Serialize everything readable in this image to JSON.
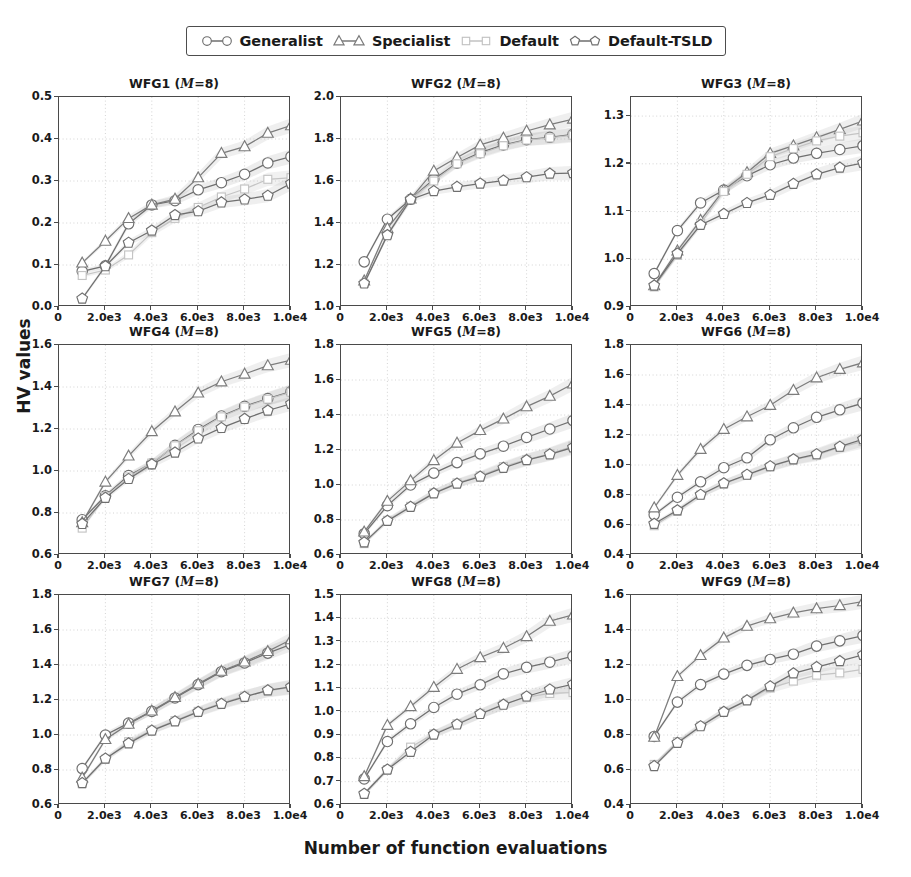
{
  "figure": {
    "xlabel": "Number of function evaluations",
    "ylabel": "HV values"
  },
  "legend": {
    "entries": [
      {
        "label": "Generalist",
        "marker": "circle",
        "color": "#6e6e6e"
      },
      {
        "label": "Specialist",
        "marker": "triangle",
        "color": "#7a7a7a"
      },
      {
        "label": "Default",
        "marker": "square",
        "color": "#c2c2c2"
      },
      {
        "label": "Default-TSLD",
        "marker": "pentagon",
        "color": "#6e6e6e"
      }
    ]
  },
  "chart_data": [
    {
      "type": "line",
      "title": "WFG1 (M=8)",
      "problem": "WFG1",
      "M": 8,
      "xlabel": "Number of function evaluations",
      "ylabel": "HV values",
      "xlim": [
        0,
        10000
      ],
      "ylim": [
        0.0,
        0.5
      ],
      "xticks": [
        0,
        2000,
        4000,
        6000,
        8000,
        10000
      ],
      "xticklabels": [
        "0",
        "2.0e3",
        "4.0e3",
        "6.0e3",
        "8.0e3",
        "1.0e4"
      ],
      "yticks": [
        0.0,
        0.1,
        0.2,
        0.3,
        0.4,
        0.5
      ],
      "yticklabels": [
        "0.0",
        "0.1",
        "0.2",
        "0.3",
        "0.4",
        "0.5"
      ],
      "grid": true,
      "legend_position": "figure-top",
      "x": [
        1000,
        2000,
        3000,
        4000,
        5000,
        6000,
        7000,
        8000,
        9000,
        10000
      ],
      "series": [
        {
          "name": "Generalist",
          "values": [
            0.085,
            0.098,
            0.198,
            0.243,
            0.253,
            0.279,
            0.296,
            0.316,
            0.343,
            0.358
          ]
        },
        {
          "name": "Specialist",
          "values": [
            0.105,
            0.157,
            0.211,
            0.243,
            0.257,
            0.308,
            0.366,
            0.382,
            0.414,
            0.432
          ]
        },
        {
          "name": "Default",
          "values": [
            0.075,
            0.088,
            0.124,
            0.177,
            0.211,
            0.237,
            0.262,
            0.281,
            0.304,
            0.308
          ]
        },
        {
          "name": "Default-TSLD",
          "values": [
            0.02,
            0.097,
            0.153,
            0.182,
            0.219,
            0.228,
            0.249,
            0.256,
            0.265,
            0.294
          ]
        }
      ]
    },
    {
      "type": "line",
      "title": "WFG2 (M=8)",
      "problem": "WFG2",
      "M": 8,
      "xlabel": "Number of function evaluations",
      "ylabel": "HV values",
      "xlim": [
        0,
        10000
      ],
      "ylim": [
        1.0,
        2.0
      ],
      "xticks": [
        0,
        2000,
        4000,
        6000,
        8000,
        10000
      ],
      "xticklabels": [
        "0",
        "2.0e3",
        "4.0e3",
        "6.0e3",
        "8.0e3",
        "1.0e4"
      ],
      "yticks": [
        1.0,
        1.2,
        1.4,
        1.6,
        1.8,
        2.0
      ],
      "yticklabels": [
        "1.0",
        "1.2",
        "1.4",
        "1.6",
        "1.8",
        "2.0"
      ],
      "grid": true,
      "legend_position": "figure-top",
      "x": [
        1000,
        2000,
        3000,
        4000,
        5000,
        6000,
        7000,
        8000,
        9000,
        10000
      ],
      "series": [
        {
          "name": "Generalist",
          "values": [
            1.215,
            1.418,
            1.513,
            1.608,
            1.685,
            1.735,
            1.772,
            1.797,
            1.808,
            1.822
          ]
        },
        {
          "name": "Specialist",
          "values": [
            1.125,
            1.375,
            1.515,
            1.648,
            1.712,
            1.772,
            1.805,
            1.838,
            1.868,
            1.895
          ]
        },
        {
          "name": "Default",
          "values": [
            1.112,
            1.345,
            1.512,
            1.6,
            1.682,
            1.73,
            1.768,
            1.795,
            1.805,
            1.818
          ]
        },
        {
          "name": "Default-TSLD",
          "values": [
            1.112,
            1.342,
            1.512,
            1.552,
            1.572,
            1.588,
            1.602,
            1.618,
            1.635,
            1.638
          ]
        }
      ]
    },
    {
      "type": "line",
      "title": "WFG3 (M=8)",
      "problem": "WFG3",
      "M": 8,
      "xlabel": "Number of function evaluations",
      "ylabel": "HV values",
      "xlim": [
        0,
        10000
      ],
      "ylim": [
        0.9,
        1.34
      ],
      "xticks": [
        0,
        2000,
        4000,
        6000,
        8000,
        10000
      ],
      "xticklabels": [
        "0",
        "2.0e3",
        "4.0e3",
        "6.0e3",
        "8.0e3",
        "1.0e4"
      ],
      "yticks": [
        0.9,
        1.0,
        1.1,
        1.2,
        1.3
      ],
      "yticklabels": [
        "0.9",
        "1.0",
        "1.1",
        "1.2",
        "1.3"
      ],
      "grid": true,
      "legend_position": "figure-top",
      "x": [
        1000,
        2000,
        3000,
        4000,
        5000,
        6000,
        7000,
        8000,
        9000,
        10000
      ],
      "series": [
        {
          "name": "Generalist",
          "values": [
            0.97,
            1.06,
            1.118,
            1.145,
            1.175,
            1.198,
            1.212,
            1.222,
            1.23,
            1.238
          ]
        },
        {
          "name": "Specialist",
          "values": [
            0.945,
            1.018,
            1.082,
            1.145,
            1.182,
            1.222,
            1.238,
            1.255,
            1.272,
            1.29
          ]
        },
        {
          "name": "Default",
          "values": [
            0.942,
            1.008,
            1.075,
            1.142,
            1.178,
            1.215,
            1.232,
            1.248,
            1.258,
            1.265
          ]
        },
        {
          "name": "Default-TSLD",
          "values": [
            0.945,
            1.012,
            1.072,
            1.095,
            1.118,
            1.135,
            1.158,
            1.178,
            1.192,
            1.202
          ]
        }
      ]
    },
    {
      "type": "line",
      "title": "WFG4 (M=8)",
      "problem": "WFG4",
      "M": 8,
      "xlabel": "Number of function evaluations",
      "ylabel": "HV values",
      "xlim": [
        0,
        10000
      ],
      "ylim": [
        0.6,
        1.6
      ],
      "xticks": [
        0,
        2000,
        4000,
        6000,
        8000,
        10000
      ],
      "xticklabels": [
        "0",
        "2.0e3",
        "4.0e3",
        "6.0e3",
        "8.0e3",
        "1.0e4"
      ],
      "yticks": [
        0.6,
        0.8,
        1.0,
        1.2,
        1.4,
        1.6
      ],
      "yticklabels": [
        "0.6",
        "0.8",
        "1.0",
        "1.2",
        "1.4",
        "1.6"
      ],
      "grid": true,
      "legend_position": "figure-top",
      "x": [
        1000,
        2000,
        3000,
        4000,
        5000,
        6000,
        7000,
        8000,
        9000,
        10000
      ],
      "series": [
        {
          "name": "Generalist",
          "values": [
            0.768,
            0.882,
            0.978,
            1.035,
            1.122,
            1.198,
            1.262,
            1.308,
            1.345,
            1.378
          ]
        },
        {
          "name": "Specialist",
          "values": [
            0.755,
            0.948,
            1.072,
            1.188,
            1.282,
            1.372,
            1.425,
            1.462,
            1.502,
            1.528
          ]
        },
        {
          "name": "Default",
          "values": [
            0.728,
            0.878,
            0.972,
            1.038,
            1.12,
            1.192,
            1.258,
            1.305,
            1.342,
            1.375
          ]
        },
        {
          "name": "Default-TSLD",
          "values": [
            0.748,
            0.872,
            0.962,
            1.032,
            1.088,
            1.155,
            1.205,
            1.248,
            1.288,
            1.32
          ]
        }
      ]
    },
    {
      "type": "line",
      "title": "WFG5 (M=8)",
      "problem": "WFG5",
      "M": 8,
      "xlabel": "Number of function evaluations",
      "ylabel": "HV values",
      "xlim": [
        0,
        10000
      ],
      "ylim": [
        0.6,
        1.8
      ],
      "xticks": [
        0,
        2000,
        4000,
        6000,
        8000,
        10000
      ],
      "xticklabels": [
        "0",
        "2.0e3",
        "4.0e3",
        "6.0e3",
        "8.0e3",
        "1.0e4"
      ],
      "yticks": [
        0.6,
        0.8,
        1.0,
        1.2,
        1.4,
        1.6,
        1.8
      ],
      "yticklabels": [
        "0.6",
        "0.8",
        "1.0",
        "1.2",
        "1.4",
        "1.6",
        "1.8"
      ],
      "grid": true,
      "legend_position": "figure-top",
      "x": [
        1000,
        2000,
        3000,
        4000,
        5000,
        6000,
        7000,
        8000,
        9000,
        10000
      ],
      "series": [
        {
          "name": "Generalist",
          "values": [
            0.722,
            0.882,
            1.0,
            1.068,
            1.128,
            1.178,
            1.222,
            1.272,
            1.32,
            1.368
          ]
        },
        {
          "name": "Specialist",
          "values": [
            0.732,
            0.908,
            1.025,
            1.14,
            1.24,
            1.312,
            1.378,
            1.448,
            1.508,
            1.578
          ]
        },
        {
          "name": "Default",
          "values": [
            0.665,
            0.798,
            0.878,
            0.955,
            1.012,
            1.052,
            1.105,
            1.145,
            1.178,
            1.222
          ]
        },
        {
          "name": "Default-TSLD",
          "values": [
            0.672,
            0.795,
            0.875,
            0.952,
            1.008,
            1.048,
            1.098,
            1.142,
            1.175,
            1.215
          ]
        }
      ]
    },
    {
      "type": "line",
      "title": "WFG6 (M=8)",
      "problem": "WFG6",
      "M": 8,
      "xlabel": "Number of function evaluations",
      "ylabel": "HV values",
      "xlim": [
        0,
        10000
      ],
      "ylim": [
        0.4,
        1.8
      ],
      "xticks": [
        0,
        2000,
        4000,
        6000,
        8000,
        10000
      ],
      "xticklabels": [
        "0",
        "2.0e3",
        "4.0e3",
        "6.0e3",
        "8.0e3",
        "1.0e4"
      ],
      "yticks": [
        0.4,
        0.6,
        0.8,
        1.0,
        1.2,
        1.4,
        1.6,
        1.8
      ],
      "yticklabels": [
        "0.4",
        "0.6",
        "0.8",
        "1.0",
        "1.2",
        "1.4",
        "1.6",
        "1.8"
      ],
      "grid": true,
      "legend_position": "figure-top",
      "x": [
        1000,
        2000,
        3000,
        4000,
        5000,
        6000,
        7000,
        8000,
        9000,
        10000
      ],
      "series": [
        {
          "name": "Generalist",
          "values": [
            0.668,
            0.785,
            0.888,
            0.982,
            1.048,
            1.168,
            1.248,
            1.318,
            1.368,
            1.412
          ]
        },
        {
          "name": "Specialist",
          "values": [
            0.715,
            0.932,
            1.105,
            1.238,
            1.322,
            1.398,
            1.498,
            1.582,
            1.638,
            1.682
          ]
        },
        {
          "name": "Default",
          "values": [
            0.595,
            0.692,
            0.8,
            0.875,
            0.932,
            0.988,
            1.035,
            1.065,
            1.118,
            1.158
          ]
        },
        {
          "name": "Default-TSLD",
          "values": [
            0.608,
            0.698,
            0.802,
            0.878,
            0.935,
            0.992,
            1.038,
            1.072,
            1.122,
            1.172
          ]
        }
      ]
    },
    {
      "type": "line",
      "title": "WFG7 (M=8)",
      "problem": "WFG7",
      "M": 8,
      "xlabel": "Number of function evaluations",
      "ylabel": "HV values",
      "xlim": [
        0,
        10000
      ],
      "ylim": [
        0.6,
        1.8
      ],
      "xticks": [
        0,
        2000,
        4000,
        6000,
        8000,
        10000
      ],
      "xticklabels": [
        "0",
        "2.0e3",
        "4.0e3",
        "6.0e3",
        "8.0e3",
        "1.0e4"
      ],
      "yticks": [
        0.6,
        0.8,
        1.0,
        1.2,
        1.4,
        1.6,
        1.8
      ],
      "yticklabels": [
        "0.6",
        "0.8",
        "1.0",
        "1.2",
        "1.4",
        "1.6",
        "1.8"
      ],
      "grid": true,
      "legend_position": "figure-top",
      "x": [
        1000,
        2000,
        3000,
        4000,
        5000,
        6000,
        7000,
        8000,
        9000,
        10000
      ],
      "series": [
        {
          "name": "Generalist",
          "values": [
            0.808,
            1.0,
            1.068,
            1.135,
            1.212,
            1.288,
            1.362,
            1.412,
            1.468,
            1.518
          ]
        },
        {
          "name": "Specialist",
          "values": [
            0.755,
            0.975,
            1.062,
            1.138,
            1.215,
            1.292,
            1.365,
            1.418,
            1.478,
            1.545
          ]
        },
        {
          "name": "Default",
          "values": [
            0.722,
            0.862,
            0.962,
            1.028,
            1.082,
            1.135,
            1.182,
            1.222,
            1.252,
            1.272
          ]
        },
        {
          "name": "Default-TSLD",
          "values": [
            0.725,
            0.865,
            0.952,
            1.025,
            1.078,
            1.132,
            1.178,
            1.218,
            1.255,
            1.275
          ]
        }
      ]
    },
    {
      "type": "line",
      "title": "WFG8 (M=8)",
      "problem": "WFG8",
      "M": 8,
      "xlabel": "Number of function evaluations",
      "ylabel": "HV values",
      "xlim": [
        0,
        10000
      ],
      "ylim": [
        0.6,
        1.5
      ],
      "xticks": [
        0,
        2000,
        4000,
        6000,
        8000,
        10000
      ],
      "xticklabels": [
        "0",
        "2.0e3",
        "4.0e3",
        "6.0e3",
        "8.0e3",
        "1.0e4"
      ],
      "yticks": [
        0.6,
        0.7,
        0.8,
        0.9,
        1.0,
        1.1,
        1.2,
        1.3,
        1.4,
        1.5
      ],
      "yticklabels": [
        "0.6",
        "0.7",
        "0.8",
        "0.9",
        "1.0",
        "1.1",
        "1.2",
        "1.3",
        "1.4",
        "1.5"
      ],
      "grid": true,
      "legend_position": "figure-top",
      "x": [
        1000,
        2000,
        3000,
        4000,
        5000,
        6000,
        7000,
        8000,
        9000,
        10000
      ],
      "series": [
        {
          "name": "Generalist",
          "values": [
            0.712,
            0.872,
            0.948,
            1.018,
            1.075,
            1.115,
            1.162,
            1.19,
            1.212,
            1.238
          ]
        },
        {
          "name": "Specialist",
          "values": [
            0.722,
            0.942,
            1.022,
            1.105,
            1.182,
            1.232,
            1.272,
            1.322,
            1.388,
            1.415
          ]
        },
        {
          "name": "Default",
          "values": [
            0.645,
            0.752,
            0.848,
            0.905,
            0.948,
            0.992,
            1.032,
            1.062,
            1.078,
            1.082
          ]
        },
        {
          "name": "Default-TSLD",
          "values": [
            0.648,
            0.752,
            0.828,
            0.902,
            0.945,
            0.99,
            1.03,
            1.065,
            1.095,
            1.118
          ]
        }
      ]
    },
    {
      "type": "line",
      "title": "WFG9 (M=8)",
      "problem": "WFG9",
      "M": 8,
      "xlabel": "Number of function evaluations",
      "ylabel": "HV values",
      "xlim": [
        0,
        10000
      ],
      "ylim": [
        0.4,
        1.6
      ],
      "xticks": [
        0,
        2000,
        4000,
        6000,
        8000,
        10000
      ],
      "xticklabels": [
        "0",
        "2.0e3",
        "4.0e3",
        "6.0e3",
        "8.0e3",
        "1.0e4"
      ],
      "yticks": [
        0.4,
        0.6,
        0.8,
        1.0,
        1.2,
        1.4,
        1.6
      ],
      "yticklabels": [
        "0.4",
        "0.6",
        "0.8",
        "1.0",
        "1.2",
        "1.4",
        "1.6"
      ],
      "grid": true,
      "legend_position": "figure-top",
      "x": [
        1000,
        2000,
        3000,
        4000,
        5000,
        6000,
        7000,
        8000,
        9000,
        10000
      ],
      "series": [
        {
          "name": "Generalist",
          "values": [
            0.792,
            0.988,
            1.088,
            1.148,
            1.198,
            1.232,
            1.262,
            1.308,
            1.338,
            1.368
          ]
        },
        {
          "name": "Specialist",
          "values": [
            0.788,
            1.135,
            1.255,
            1.355,
            1.422,
            1.465,
            1.498,
            1.522,
            1.54,
            1.562
          ]
        },
        {
          "name": "Default",
          "values": [
            0.632,
            0.762,
            0.852,
            0.935,
            0.998,
            1.068,
            1.108,
            1.142,
            1.155,
            1.175
          ]
        },
        {
          "name": "Default-TSLD",
          "values": [
            0.622,
            0.755,
            0.85,
            0.932,
            0.998,
            1.078,
            1.152,
            1.188,
            1.222,
            1.258
          ]
        }
      ]
    }
  ]
}
